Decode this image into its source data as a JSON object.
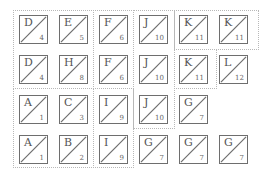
{
  "regions": [
    {
      "id": "r1",
      "x": 13,
      "y": 10,
      "w": 81,
      "h": 79
    },
    {
      "id": "r2",
      "x": 93,
      "y": 10,
      "w": 41,
      "h": 79
    },
    {
      "id": "r3",
      "x": 133,
      "y": 10,
      "w": 42,
      "h": 119
    },
    {
      "id": "r4a",
      "x": 174,
      "y": 10,
      "w": 85,
      "h": 40
    },
    {
      "id": "r4b",
      "x": 174,
      "y": 49,
      "w": 43,
      "h": 40
    },
    {
      "id": "r5",
      "x": 13,
      "y": 88,
      "w": 81,
      "h": 80
    },
    {
      "id": "r6",
      "x": 93,
      "y": 88,
      "w": 41,
      "h": 80
    }
  ],
  "tiles": [
    {
      "letter": "D",
      "number": "4",
      "row": 0,
      "col": 0
    },
    {
      "letter": "E",
      "number": "5",
      "row": 0,
      "col": 1
    },
    {
      "letter": "F",
      "number": "6",
      "row": 0,
      "col": 2
    },
    {
      "letter": "J",
      "number": "10",
      "row": 0,
      "col": 3
    },
    {
      "letter": "K",
      "number": "11",
      "row": 0,
      "col": 4
    },
    {
      "letter": "K",
      "number": "11",
      "row": 0,
      "col": 5
    },
    {
      "letter": "D",
      "number": "4",
      "row": 1,
      "col": 0
    },
    {
      "letter": "H",
      "number": "8",
      "row": 1,
      "col": 1
    },
    {
      "letter": "F",
      "number": "6",
      "row": 1,
      "col": 2
    },
    {
      "letter": "J",
      "number": "10",
      "row": 1,
      "col": 3
    },
    {
      "letter": "K",
      "number": "11",
      "row": 1,
      "col": 4
    },
    {
      "letter": "L",
      "number": "12",
      "row": 1,
      "col": 5
    },
    {
      "letter": "A",
      "number": "1",
      "row": 2,
      "col": 0
    },
    {
      "letter": "C",
      "number": "3",
      "row": 2,
      "col": 1
    },
    {
      "letter": "I",
      "number": "9",
      "row": 2,
      "col": 2
    },
    {
      "letter": "J",
      "number": "10",
      "row": 2,
      "col": 3
    },
    {
      "letter": "G",
      "number": "7",
      "row": 2,
      "col": 4
    },
    {
      "letter": "A",
      "number": "1",
      "row": 3,
      "col": 0
    },
    {
      "letter": "B",
      "number": "2",
      "row": 3,
      "col": 1
    },
    {
      "letter": "I",
      "number": "9",
      "row": 3,
      "col": 2
    },
    {
      "letter": "G",
      "number": "7",
      "row": 3,
      "col": 3
    },
    {
      "letter": "G",
      "number": "7",
      "row": 3,
      "col": 4
    },
    {
      "letter": "G",
      "number": "7",
      "row": 3,
      "col": 5
    }
  ],
  "colors": {
    "tile_border": "#6e6e6e",
    "region_border": "#b8b8b8",
    "text": "#555555"
  }
}
